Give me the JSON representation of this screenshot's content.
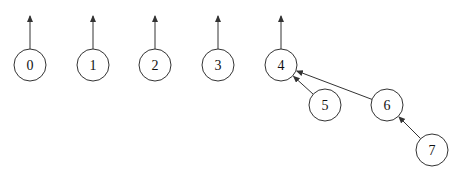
{
  "diagram": {
    "type": "union-find forest",
    "style": {
      "stroke": "#333333",
      "background": "#ffffff",
      "node_radius": 16
    },
    "nodes": [
      {
        "id": "0",
        "label": "0",
        "x": 30,
        "y": 65
      },
      {
        "id": "1",
        "label": "1",
        "x": 93,
        "y": 65
      },
      {
        "id": "2",
        "label": "2",
        "x": 155,
        "y": 65
      },
      {
        "id": "3",
        "label": "3",
        "x": 218,
        "y": 65
      },
      {
        "id": "4",
        "label": "4",
        "x": 281,
        "y": 65
      },
      {
        "id": "5",
        "label": "5",
        "x": 325,
        "y": 105
      },
      {
        "id": "6",
        "label": "6",
        "x": 387,
        "y": 105
      },
      {
        "id": "7",
        "label": "7",
        "x": 432,
        "y": 150
      }
    ],
    "root_arrows": [
      "0",
      "1",
      "2",
      "3",
      "4"
    ],
    "edges": [
      {
        "from": "5",
        "to": "4"
      },
      {
        "from": "6",
        "to": "4"
      },
      {
        "from": "7",
        "to": "6"
      }
    ]
  }
}
